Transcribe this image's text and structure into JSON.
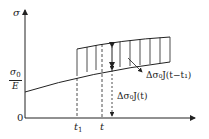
{
  "diagram": {
    "y_axis_label": "σ",
    "y_tick_label": {
      "num": "σ",
      "num_sub": "0",
      "den": "E"
    },
    "origin_label": "0",
    "x_ticks": [
      {
        "label": "t",
        "sub": "1"
      },
      {
        "label": "t",
        "sub": ""
      }
    ],
    "annotations": {
      "upper_increment": "Δσ₀J(t−t₁)",
      "lower_increment": "Δσ₀J(t)"
    },
    "colors": {
      "line": "#222222",
      "background": "#ffffff"
    }
  }
}
